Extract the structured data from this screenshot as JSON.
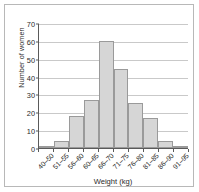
{
  "chart_data": {
    "type": "bar",
    "title": "",
    "subtitle": "",
    "xlabel": "Weight (kg)",
    "ylabel": "Number of women",
    "categories": [
      "40–50",
      "51–55",
      "56–60",
      "60–65",
      "66–70",
      "71–75",
      "76–80",
      "81–85",
      "86–90",
      "91–95"
    ],
    "values": [
      1,
      4,
      18,
      27,
      60,
      44,
      25,
      17,
      4,
      1
    ],
    "ylim": [
      0,
      70
    ],
    "yticks": [
      0,
      10,
      20,
      30,
      40,
      50,
      60,
      70
    ],
    "ytick_labels": [
      "0",
      "10",
      "20",
      "30",
      "40",
      "50",
      "60",
      "70"
    ],
    "grid": true,
    "grid_axis": "y",
    "legend": false,
    "legend_position": "none",
    "bar_fill_color": "#d6d6d6",
    "bar_edge_color": "#9a9a9a",
    "grid_color": "#c9c9c9",
    "axis_color": "#5a5a5a",
    "text_color": "#2b2b2b",
    "background_color": "#ffffff",
    "frame_color": "#b8b8b8",
    "xtick_rotation": -45
  }
}
